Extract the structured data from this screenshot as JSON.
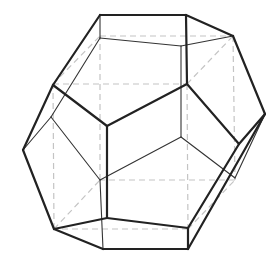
{
  "figure": {
    "colors": {
      "background": "#ffffff",
      "front_edges": "#222222",
      "back_edges": "#333333",
      "cube_dashes": "#c4c4c4"
    },
    "front_edges": [
      [
        100,
        15,
        186,
        15
      ],
      [
        186,
        15,
        233,
        36
      ],
      [
        233,
        36,
        265,
        114
      ],
      [
        100,
        15,
        53,
        85
      ],
      [
        53,
        85,
        23,
        150
      ],
      [
        23,
        150,
        54,
        229
      ],
      [
        54,
        229,
        103,
        249
      ],
      [
        103,
        249,
        188,
        249
      ],
      [
        188,
        249,
        265,
        114
      ],
      [
        186,
        15,
        187,
        84
      ],
      [
        187,
        84,
        107,
        126
      ],
      [
        53,
        85,
        107,
        126
      ],
      [
        107,
        126,
        107,
        218
      ],
      [
        187,
        84,
        239,
        144
      ],
      [
        239,
        144,
        265,
        114
      ],
      [
        239,
        144,
        188,
        228
      ],
      [
        188,
        228,
        188,
        249
      ],
      [
        188,
        228,
        107,
        218
      ],
      [
        107,
        218,
        54,
        229
      ]
    ],
    "back_edges": [
      [
        100,
        15,
        100,
        38
      ],
      [
        100,
        38,
        181,
        46
      ],
      [
        181,
        46,
        233,
        36
      ],
      [
        100,
        38,
        51,
        117
      ],
      [
        51,
        117,
        23,
        150
      ],
      [
        51,
        117,
        100,
        180
      ],
      [
        181,
        46,
        181,
        137
      ],
      [
        181,
        137,
        100,
        180
      ],
      [
        181,
        137,
        235,
        178
      ],
      [
        235,
        178,
        265,
        114
      ],
      [
        100,
        180,
        103,
        249
      ]
    ],
    "cube_edges": [
      [
        53,
        84,
        187,
        84
      ],
      [
        187,
        84,
        188,
        229
      ],
      [
        188,
        229,
        54,
        229
      ],
      [
        54,
        229,
        53,
        84
      ],
      [
        100,
        36,
        233,
        36
      ],
      [
        233,
        36,
        235,
        180
      ],
      [
        235,
        180,
        100,
        180
      ],
      [
        100,
        180,
        100,
        36
      ],
      [
        53,
        84,
        100,
        36
      ],
      [
        187,
        84,
        233,
        36
      ],
      [
        188,
        229,
        235,
        180
      ],
      [
        54,
        229,
        100,
        180
      ]
    ]
  }
}
